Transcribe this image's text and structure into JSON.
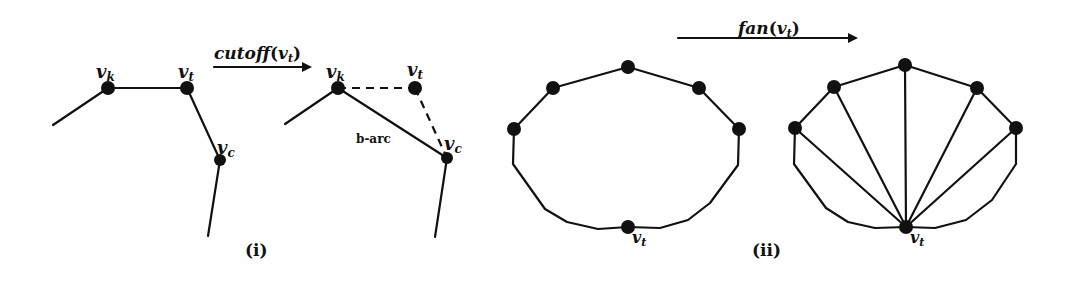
{
  "figure": {
    "panel_i": {
      "caption": "(i)",
      "operation_label": "cutoff",
      "operation_arg": "v",
      "operation_arg_sub": "t",
      "before": {
        "nodes": [
          {
            "id": "vk",
            "label": "v",
            "sub": "k",
            "x": 108,
            "y": 88
          },
          {
            "id": "vt",
            "label": "v",
            "sub": "t",
            "x": 187,
            "y": 88
          },
          {
            "id": "vc",
            "label": "v",
            "sub": "c",
            "x": 220,
            "y": 160
          }
        ]
      },
      "after": {
        "nodes": [
          {
            "id": "vk",
            "label": "v",
            "sub": "k",
            "x": 338,
            "y": 88
          },
          {
            "id": "vt",
            "label": "v",
            "sub": "t",
            "x": 415,
            "y": 88
          },
          {
            "id": "vc",
            "label": "v",
            "sub": "c",
            "x": 447,
            "y": 158
          }
        ],
        "new_edge_label": "b-arc"
      }
    },
    "panel_ii": {
      "caption": "(ii)",
      "operation_label": "fan",
      "operation_arg": "v",
      "operation_arg_sub": "t",
      "apex_label": "v",
      "apex_sub": "t"
    }
  }
}
